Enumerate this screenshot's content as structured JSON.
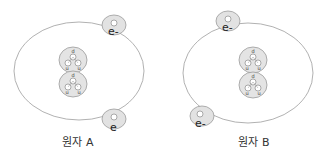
{
  "diagram": {
    "atoms": [
      {
        "id": "A",
        "label": "원자 A",
        "orbit": {
          "cx": 79,
          "cy": 71,
          "rx": 65,
          "ry": 49
        },
        "nucleus": {
          "nucleons": [
            {
              "cx": 73,
              "cy": 60,
              "r": 14,
              "quarks": [
                "d",
                "u",
                "u"
              ]
            },
            {
              "cx": 73,
              "cy": 83,
              "r": 14,
              "quarks": [
                "d",
                "u",
                "u"
              ]
            }
          ]
        },
        "electrons": [
          {
            "cx": 113,
            "cy": 25,
            "r": 11,
            "label": "e-"
          },
          {
            "cx": 113,
            "cy": 119,
            "r": 11,
            "label": "e"
          }
        ]
      },
      {
        "id": "B",
        "label": "원자 B",
        "orbit": {
          "cx": 248,
          "cy": 73,
          "rx": 65,
          "ry": 50
        },
        "nucleus": {
          "nucleons": [
            {
              "cx": 253,
              "cy": 59,
              "r": 14,
              "quarks": [
                "d",
                "u",
                "u"
              ]
            },
            {
              "cx": 253,
              "cy": 84,
              "r": 14,
              "quarks": [
                "d",
                "u",
                "u"
              ]
            }
          ]
        },
        "electrons": [
          {
            "cx": 228,
            "cy": 21,
            "r": 11,
            "label": "e-"
          },
          {
            "cx": 201,
            "cy": 116,
            "r": 11,
            "label": "e-"
          }
        ]
      }
    ],
    "colors": {
      "orbit": "#a8a8a8",
      "particle_fill": "#e4e4e4",
      "quark_fill": "#ffffff",
      "text": "#333333"
    }
  }
}
